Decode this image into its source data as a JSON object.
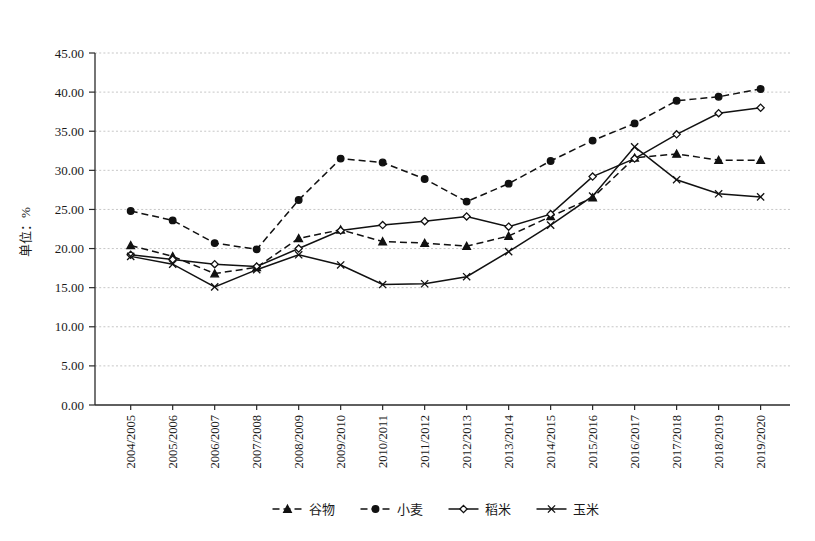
{
  "chart_data": {
    "type": "line",
    "title": "",
    "xlabel": "",
    "ylabel": "单位：%",
    "ylim": [
      0,
      45
    ],
    "ytick_step": 5,
    "ytick_labels": [
      "0.00",
      "5.00",
      "10.00",
      "15.00",
      "20.00",
      "25.00",
      "30.00",
      "35.00",
      "40.00",
      "45.00"
    ],
    "grid": true,
    "legend_position": "bottom",
    "categories": [
      "2004/2005",
      "2005/2006",
      "2006/2007",
      "2007/2008",
      "2008/2009",
      "2009/2010",
      "2010/2011",
      "2011/2012",
      "2012/2013",
      "2013/2014",
      "2014/2015",
      "2015/2016",
      "2016/2017",
      "2017/2018",
      "2018/2019",
      "2019/2020"
    ],
    "series": [
      {
        "name": "谷物",
        "style": "dashed",
        "marker": "triangle",
        "values": [
          20.4,
          19.0,
          16.8,
          17.6,
          21.3,
          22.4,
          20.9,
          20.7,
          20.3,
          21.6,
          24.1,
          26.5,
          31.6,
          32.1,
          31.3,
          31.3
        ]
      },
      {
        "name": "小麦",
        "style": "dashed",
        "marker": "circle",
        "values": [
          24.8,
          23.6,
          20.7,
          19.9,
          26.2,
          31.5,
          31.0,
          28.9,
          26.0,
          28.3,
          31.2,
          33.8,
          36.0,
          38.9,
          39.4,
          40.4
        ]
      },
      {
        "name": "稻米",
        "style": "solid",
        "marker": "diamond",
        "values": [
          19.2,
          18.6,
          18.0,
          17.7,
          20.0,
          22.3,
          23.0,
          23.5,
          24.1,
          22.8,
          24.4,
          29.2,
          31.5,
          34.6,
          37.3,
          38.0
        ]
      },
      {
        "name": "玉米",
        "style": "solid",
        "marker": "cross",
        "values": [
          19.0,
          18.0,
          15.1,
          17.3,
          19.2,
          17.9,
          15.4,
          15.5,
          16.4,
          19.6,
          23.0,
          26.7,
          33.0,
          28.8,
          27.0,
          26.6
        ]
      }
    ],
    "final_label_values": {
      "谷物": 30.1,
      "玉米": 26.6
    }
  }
}
